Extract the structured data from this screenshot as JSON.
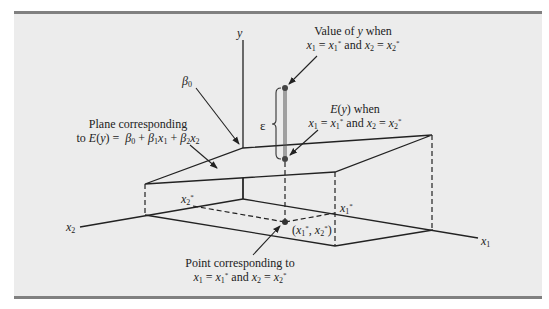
{
  "figure": {
    "axes": {
      "y": "y",
      "x1": "x1",
      "x2": "x2"
    },
    "labels": {
      "value_of_y_line1": "Value of y when",
      "value_of_y_line2": "x1 = x1* and x2 = x2*",
      "expected_y_line1": "E(y) when",
      "expected_y_line2": "x1 = x1* and x2 = x2*",
      "plane_line1": "Plane corresponding",
      "plane_line2": "to E(y) = β0 + β1x1 + β2x2",
      "intercept": "β0",
      "epsilon": "ε",
      "x1_star": "x1*",
      "x2_star": "x2*",
      "point_coords": "(x1*, x2*)",
      "point_line1": "Point corresponding to",
      "point_line2": "x1 = x1* and x2 = x2*"
    },
    "colors": {
      "background": "#ececec",
      "rule": "#808080",
      "line": "#222222",
      "dot": "#444444"
    }
  }
}
